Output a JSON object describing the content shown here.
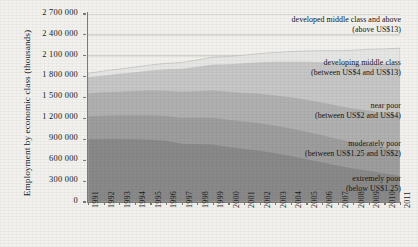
{
  "chart_data": {
    "type": "area",
    "title": "",
    "xlabel": "",
    "ylabel": "Employment by economic class (thousands)",
    "stacked": true,
    "grid": true,
    "grid_axis": "y",
    "legend": "inline-annotations",
    "ylim": [
      0,
      2700000
    ],
    "yticks": [
      0,
      300000,
      600000,
      900000,
      1200000,
      1500000,
      1800000,
      2100000,
      2400000,
      2700000
    ],
    "ytick_labels": [
      "0",
      "300 000",
      "600 000",
      "900 000",
      "1 200 000",
      "1 500 000",
      "1 800 000",
      "2 100 000",
      "2 400 000",
      "2 700 000"
    ],
    "categories": [
      1991,
      1992,
      1993,
      1994,
      1995,
      1996,
      1997,
      1998,
      1999,
      2000,
      2001,
      2002,
      2003,
      2004,
      2005,
      2006,
      2007,
      2008,
      2009,
      2010,
      2011
    ],
    "xtick_labels": [
      "1991",
      "1992",
      "1993",
      "1994",
      "1995",
      "1996",
      "1997",
      "1998",
      "1999",
      "2000",
      "2001",
      "2002",
      "2003",
      "2004",
      "2005",
      "2006",
      "2007",
      "2008",
      "2009",
      "2010",
      "2011"
    ],
    "series": [
      {
        "name": "extremely poor",
        "label_line1": "extremely poor",
        "label_line2": "(below US$1.25)",
        "color": "#898989",
        "order": 0,
        "values": [
          900000,
          905000,
          905000,
          900000,
          895000,
          880000,
          835000,
          830000,
          825000,
          790000,
          760000,
          735000,
          700000,
          660000,
          615000,
          570000,
          520000,
          480000,
          450000,
          410000,
          375000
        ]
      },
      {
        "name": "moderately poor",
        "label_line1": "moderately poor",
        "label_line2": "(between US$1.25 and US$2)",
        "color": "#9d9d9d",
        "order": 1,
        "values": [
          330000,
          335000,
          340000,
          345000,
          350000,
          355000,
          375000,
          380000,
          385000,
          390000,
          395000,
          395000,
          395000,
          395000,
          395000,
          390000,
          385000,
          378000,
          372000,
          368000,
          362000
        ]
      },
      {
        "name": "near poor",
        "label_line1": "near poor",
        "label_line2": "(between US$2 and US$4)",
        "color": "#b0b0b0",
        "order": 2,
        "values": [
          330000,
          335000,
          340000,
          348000,
          355000,
          362000,
          372000,
          382000,
          392000,
          402000,
          412000,
          424000,
          436000,
          448000,
          458000,
          468000,
          476000,
          484000,
          492000,
          500000,
          508000
        ]
      },
      {
        "name": "developing middle class",
        "label_line1": "developing middle class",
        "label_line2": "(between US$4 and US$13)",
        "color": "#c6c6c6",
        "order": 3,
        "values": [
          230000,
          242000,
          256000,
          272000,
          290000,
          310000,
          332000,
          352000,
          374000,
          398000,
          424000,
          452000,
          482000,
          512000,
          545000,
          578000,
          612000,
          645000,
          675000,
          705000,
          735000
        ]
      },
      {
        "name": "developed middle class and above",
        "label_line1": "developed middle class and above",
        "label_line2": "(above US$13)",
        "color": "#e6e6e4",
        "order": 4,
        "values": [
          60000,
          64000,
          68000,
          73000,
          78000,
          84000,
          90000,
          96000,
          103000,
          110000,
          118000,
          126000,
          135000,
          145000,
          156000,
          168000,
          180000,
          192000,
          204000,
          216000,
          228000
        ]
      }
    ],
    "totals": [
      1850000,
      1881000,
      1909000,
      1938000,
      1968000,
      1991000,
      2004000,
      2040000,
      2079000,
      2090000,
      2109000,
      2132000,
      2148000,
      2160000,
      2169000,
      2174000,
      2173000,
      2179000,
      2193000,
      2199000,
      2208000
    ]
  },
  "axis": {
    "y_title": "Employment by economic class (thousands)"
  },
  "colors": {
    "background": "#f2f1ed",
    "axis": "#7d7b76",
    "grid": "#c9c8c4",
    "text": "#1c1c1c"
  }
}
